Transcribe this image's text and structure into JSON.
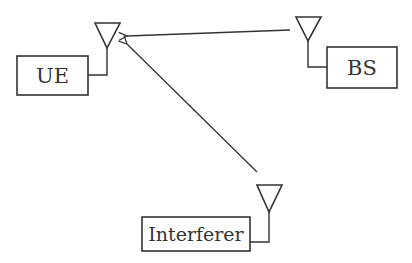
{
  "diagram": {
    "type": "wireless-interference-scenario",
    "stroke_color": "#333333",
    "background": "#ffffff",
    "nodes": [
      {
        "id": "ue",
        "label": "UE",
        "box": [
          17,
          56,
          88,
          95
        ],
        "antenna_apex": [
          107,
          48
        ]
      },
      {
        "id": "bs",
        "label": "BS",
        "box": [
          327,
          47,
          397,
          88
        ],
        "antenna_apex": [
          308,
          41
        ]
      },
      {
        "id": "interferer",
        "label": "Interferer",
        "box": [
          142,
          217,
          250,
          251
        ],
        "antenna_apex": [
          269,
          212
        ]
      }
    ],
    "edges": [
      {
        "from": "bs",
        "to": "ue",
        "kind": "desired-signal",
        "start": [
          290,
          30
        ],
        "end": [
          126,
          36
        ]
      },
      {
        "from": "interferer",
        "to": "ue",
        "kind": "interference",
        "start": [
          257,
          172
        ],
        "end": [
          126,
          43
        ]
      }
    ]
  },
  "labels": {
    "ue": "UE",
    "bs": "BS",
    "interferer": "Interferer"
  }
}
